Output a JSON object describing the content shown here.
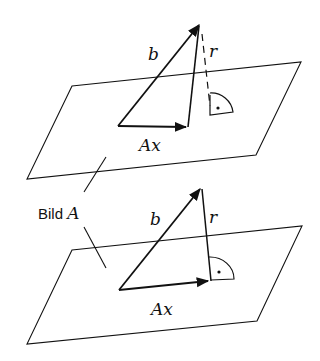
{
  "diagram": {
    "top": {
      "vector_b_label": "b",
      "vector_r_label": "r",
      "vector_ax_label": "Ax",
      "r_style": "dashed"
    },
    "bottom": {
      "vector_b_label": "b",
      "vector_r_label": "r",
      "vector_ax_label": "Ax",
      "r_style": "solid"
    },
    "plane_label": {
      "text": "Bild ",
      "math": "A"
    },
    "colors": {
      "stroke": "#111111",
      "background": "#ffffff"
    }
  }
}
